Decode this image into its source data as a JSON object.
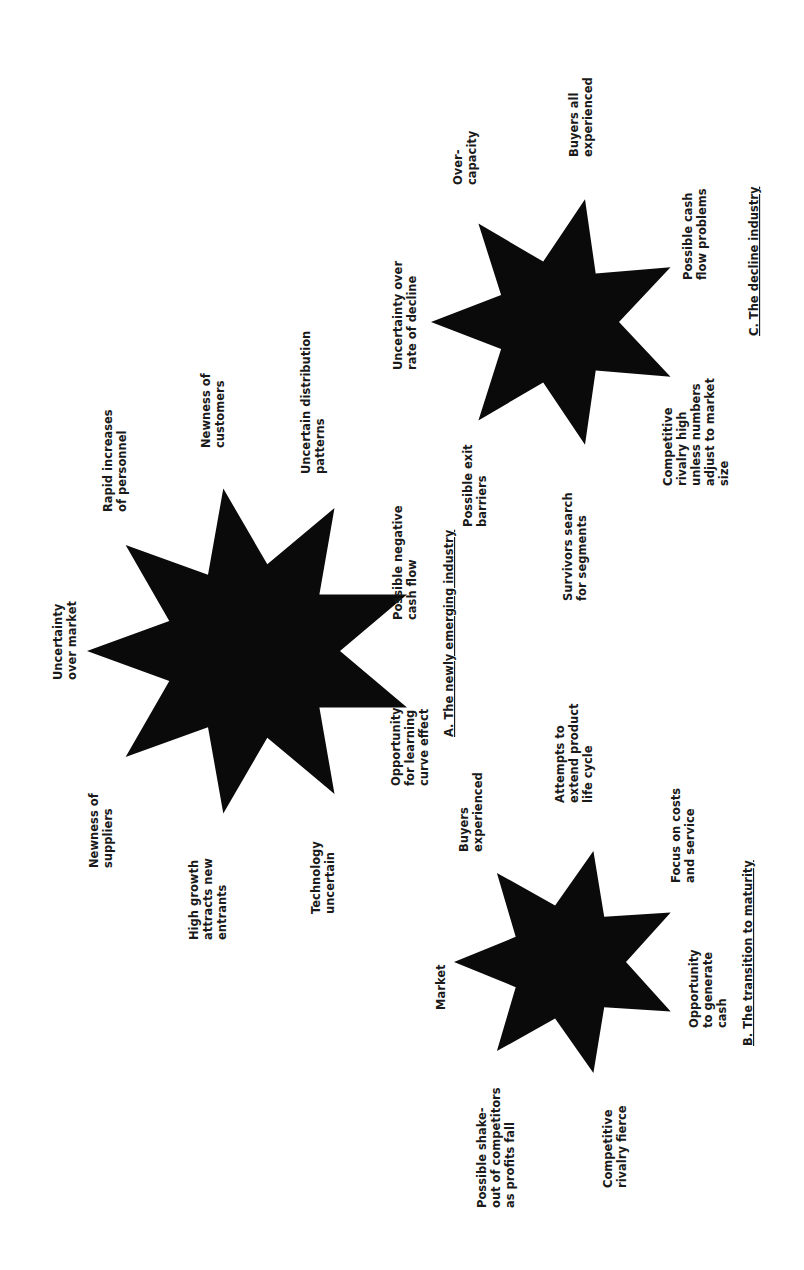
{
  "page": {
    "orientation": "rotated-90-ccw",
    "background": "#ffffff",
    "ink": "#0a0a0a"
  },
  "diagrams": [
    {
      "id": "A",
      "title": "A. The newly emerging industry",
      "title_pos": {
        "x": 453,
        "y": 737
      },
      "star": {
        "points": 9,
        "cx": 252,
        "cy": 651,
        "r_outer": 165,
        "r_inner": 88,
        "start_angle": 180
      },
      "labels": [
        {
          "lines": [
            "Uncertainty",
            "over market"
          ],
          "x": 62,
          "y": 680
        },
        {
          "lines": [
            "Newness of",
            "suppliers"
          ],
          "x": 98,
          "y": 868
        },
        {
          "lines": [
            "High growth",
            "attracts new",
            "entrants"
          ],
          "x": 198,
          "y": 940
        },
        {
          "lines": [
            "Technology",
            "uncertain"
          ],
          "x": 320,
          "y": 914
        },
        {
          "lines": [
            "Opportunity",
            "for learning",
            "curve effect"
          ],
          "x": 400,
          "y": 786
        },
        {
          "lines": [
            "Possible negative",
            "cash flow"
          ],
          "x": 402,
          "y": 620
        },
        {
          "lines": [
            "Uncertain distribution",
            "patterns"
          ],
          "x": 310,
          "y": 474
        },
        {
          "lines": [
            "Newness of",
            "customers"
          ],
          "x": 210,
          "y": 448
        },
        {
          "lines": [
            "Rapid increases",
            "of personnel"
          ],
          "x": 112,
          "y": 512
        }
      ]
    },
    {
      "id": "B",
      "title": "B. The transition to maturity",
      "title_pos": {
        "x": 752,
        "y": 1046
      },
      "star": {
        "points": 7,
        "cx": 568,
        "cy": 962,
        "r_outer": 114,
        "r_inner": 58,
        "start_angle": 180
      },
      "labels": [
        {
          "lines": [
            "Buyers",
            "experienced"
          ],
          "x": 468,
          "y": 852
        },
        {
          "lines": [
            "Attempts to",
            "extend product",
            "life cycle"
          ],
          "x": 564,
          "y": 803
        },
        {
          "lines": [
            "Focus on costs",
            "and service"
          ],
          "x": 680,
          "y": 883
        },
        {
          "lines": [
            "Market"
          ],
          "x": 445,
          "y": 1010
        },
        {
          "lines": [
            "Opportunity",
            "to generate",
            "cash"
          ],
          "x": 698,
          "y": 1028
        },
        {
          "lines": [
            "Possible shake-",
            "out of competitors",
            "as profits fall"
          ],
          "x": 486,
          "y": 1208
        },
        {
          "lines": [
            "Competitive",
            "rivalry fierce"
          ],
          "x": 612,
          "y": 1188
        }
      ]
    },
    {
      "id": "C",
      "title": "C. The decline industry",
      "title_pos": {
        "x": 758,
        "y": 336
      },
      "star": {
        "points": 7,
        "cx": 557,
        "cy": 322,
        "r_outer": 126,
        "r_inner": 62,
        "start_angle": 180
      },
      "labels": [
        {
          "lines": [
            "Uncertainty over",
            "rate of decline"
          ],
          "x": 402,
          "y": 370
        },
        {
          "lines": [
            "Over-",
            "capacity"
          ],
          "x": 462,
          "y": 185
        },
        {
          "lines": [
            "Buyers all",
            "experienced"
          ],
          "x": 578,
          "y": 157
        },
        {
          "lines": [
            "Possible cash",
            "flow problems"
          ],
          "x": 692,
          "y": 280
        },
        {
          "lines": [
            "Competitive",
            "rivalry high",
            "unless numbers",
            "adjust to market",
            "size"
          ],
          "x": 672,
          "y": 486
        },
        {
          "lines": [
            "Possible exit",
            "barriers"
          ],
          "x": 472,
          "y": 527
        },
        {
          "lines": [
            "Survivors search",
            "for segments"
          ],
          "x": 572,
          "y": 601
        }
      ]
    }
  ]
}
